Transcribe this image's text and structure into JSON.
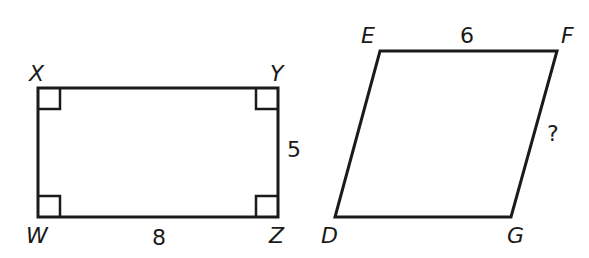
{
  "figures": {
    "rectangle": {
      "vertices": {
        "X": "X",
        "Y": "Y",
        "Z": "Z",
        "W": "W"
      },
      "side_labels": {
        "YZ": "5",
        "WZ": "8"
      },
      "right_angle_marks": 4
    },
    "parallelogram": {
      "vertices": {
        "E": "E",
        "F": "F",
        "G": "G",
        "D": "D"
      },
      "side_labels": {
        "EF": "6",
        "FG": "?"
      }
    }
  },
  "colors": {
    "stroke": "#1a1a1a",
    "background": "#ffffff"
  }
}
